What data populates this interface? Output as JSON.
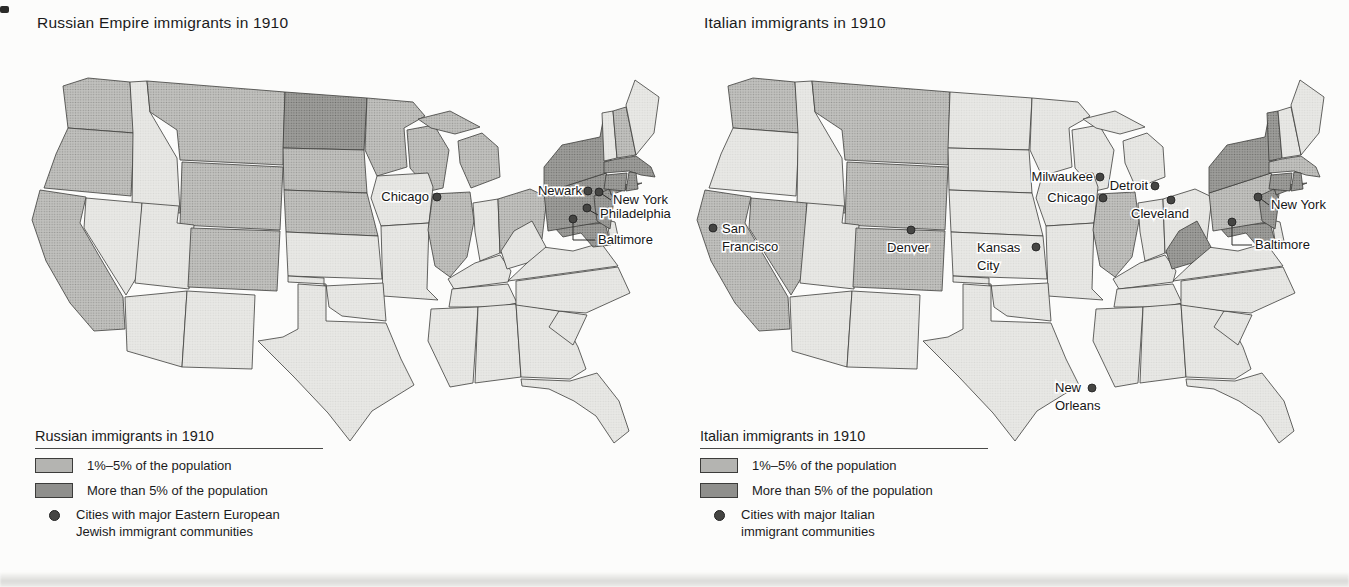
{
  "colors": {
    "state_none": "#e4e4e1",
    "state_1_5": "#b4b4b1",
    "state_over_5": "#8f8f8c",
    "state_border": "#3d3d3b",
    "city_dot": "#454543",
    "text": "#1b1b1b"
  },
  "maps": [
    {
      "id": "russian",
      "title": "Russian Empire immigrants in 1910",
      "legend_title": "Russian immigrants in 1910",
      "legend": [
        {
          "type": "swatch",
          "category": "1_5",
          "label": "1%–5% of the population"
        },
        {
          "type": "swatch",
          "category": "over_5",
          "label": "More than 5% of the population"
        },
        {
          "type": "city-dot",
          "lines": [
            "Cities with major Eastern European",
            "Jewish immigrant communities"
          ]
        }
      ],
      "states_1_5": [
        "WA",
        "OR",
        "CA",
        "MT",
        "WY",
        "CO",
        "SD",
        "NE",
        "MN",
        "WI",
        "MI",
        "IL",
        "OH",
        "NH"
      ],
      "states_over_5": [
        "ND",
        "NY",
        "NJ",
        "PA",
        "CT",
        "MA",
        "RI",
        "MD"
      ],
      "cities": [
        {
          "id": "chicago",
          "label": "Chicago"
        },
        {
          "id": "newark",
          "label": "Newark"
        },
        {
          "id": "new_york",
          "label": "New York"
        },
        {
          "id": "philadelphia",
          "label": "Philadelphia"
        },
        {
          "id": "baltimore",
          "label": "Baltimore"
        }
      ]
    },
    {
      "id": "italian",
      "title": "Italian immigrants in 1910",
      "legend_title": "Italian immigrants in 1910",
      "legend": [
        {
          "type": "swatch",
          "category": "1_5",
          "label": "1%–5% of the population"
        },
        {
          "type": "swatch",
          "category": "over_5",
          "label": "More than 5% of the population"
        },
        {
          "type": "city-dot",
          "lines": [
            "Cities with major Italian",
            "immigrant communities"
          ]
        }
      ],
      "states_1_5": [
        "WA",
        "MT",
        "WY",
        "CO",
        "NV",
        "CA",
        "IL",
        "PA",
        "MA"
      ],
      "states_over_5": [
        "VT",
        "NY",
        "NJ",
        "CT",
        "RI",
        "WV",
        "MD",
        "LA"
      ],
      "cities": [
        {
          "id": "milwaukee",
          "label": "Milwaukee"
        },
        {
          "id": "detroit",
          "label": "Detroit"
        },
        {
          "id": "chicago",
          "label": "Chicago"
        },
        {
          "id": "cleveland",
          "label": "Cleveland"
        },
        {
          "id": "new_york",
          "label": "New York"
        },
        {
          "id": "baltimore",
          "label": "Baltimore"
        },
        {
          "id": "san_francisco",
          "label": "San\nFrancisco"
        },
        {
          "id": "denver",
          "label": "Denver"
        },
        {
          "id": "kansas_city",
          "label": "Kansas\nCity"
        },
        {
          "id": "new_orleans",
          "label": "New\nOrleans"
        }
      ]
    }
  ]
}
